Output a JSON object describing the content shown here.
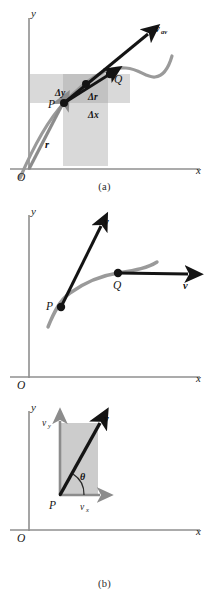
{
  "figure": {
    "panels": [
      {
        "id": "a",
        "caption": "(a)",
        "axis_y": "y",
        "axis_x": "x",
        "origin": "O",
        "labels": {
          "point_p": "P",
          "point_q": "Q",
          "vector_r": "r",
          "vector_v_av": "v",
          "vector_v_av_sub": "av",
          "delta_y": "Δy",
          "delta_r": "Δr",
          "delta_x": "Δx"
        }
      },
      {
        "id": "b",
        "caption": "(b)",
        "axis_y": "y",
        "axis_x": "x",
        "origin": "O",
        "labels": {
          "point_p": "P",
          "point_q": "Q",
          "vector_v_at_p": "v",
          "vector_v_at_q": "v"
        }
      },
      {
        "id": "c",
        "caption": "(c)",
        "axis_y": "y",
        "axis_x": "x",
        "origin": "O",
        "labels": {
          "point_p": "P",
          "vector_v": "v",
          "component_vy": "v",
          "component_vy_sub": "y",
          "component_vx": "v",
          "component_vx_sub": "x",
          "angle_theta": "θ"
        }
      }
    ],
    "colors": {
      "background": "#ffffff",
      "axis": "#8f8f8f",
      "trajectory": "#9a9a9a",
      "vector_dark": "#141414",
      "vector_gray": "#8c8c8c",
      "shade_light": "#d9d9d9",
      "shade_dark": "#c2c2c2",
      "text": "#1a1a1a"
    }
  }
}
